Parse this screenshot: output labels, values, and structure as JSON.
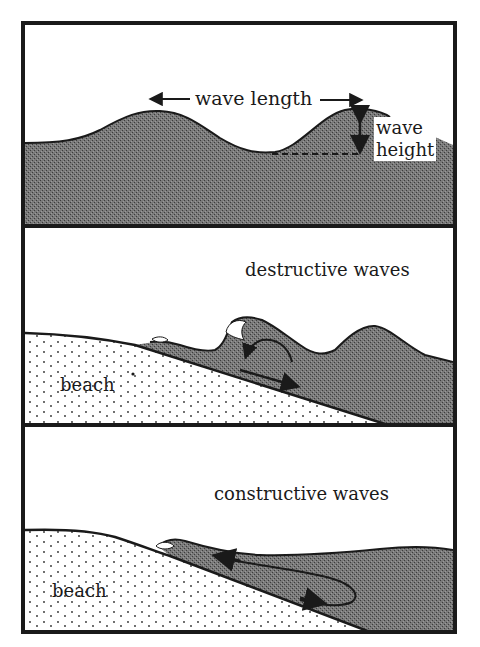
{
  "figure": {
    "colors": {
      "ink": "#1a1a1a",
      "water": "#6e6e6e",
      "sand_dots": "#2a2a2a",
      "background": "#ffffff"
    }
  },
  "panels": [
    {
      "id": "wave-anatomy",
      "labels": {
        "wave_length": "wave length",
        "wave_height_line1": "wave",
        "wave_height_line2": "height"
      }
    },
    {
      "id": "destructive",
      "labels": {
        "title": "destructive waves",
        "beach": "beach"
      }
    },
    {
      "id": "constructive",
      "labels": {
        "title": "constructive waves",
        "beach": "beach"
      }
    }
  ]
}
